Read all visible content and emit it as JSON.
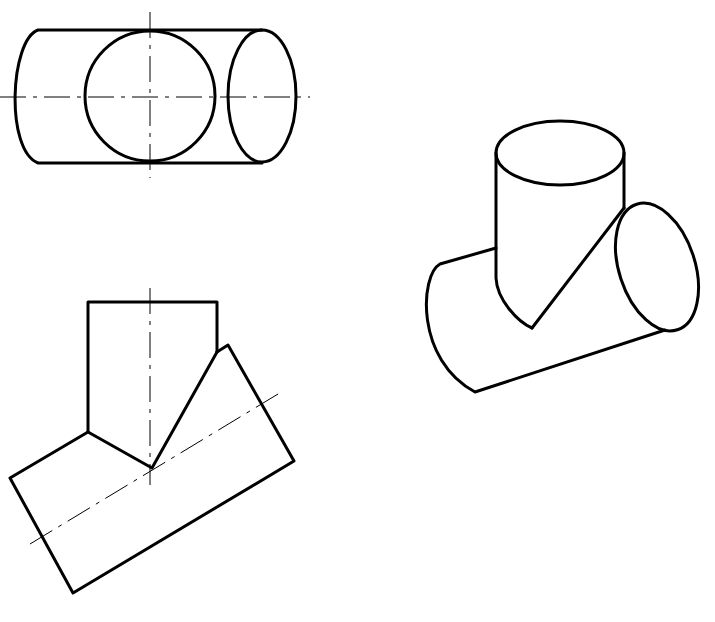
{
  "figure": {
    "views": [
      {
        "name": "top-view",
        "label": ""
      },
      {
        "name": "front-view",
        "label": ""
      },
      {
        "name": "isometric-view",
        "label": ""
      }
    ],
    "line_color": "#000000",
    "background": "#ffffff"
  }
}
